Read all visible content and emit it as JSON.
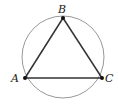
{
  "diagram": {
    "type": "geometry",
    "circle": {
      "cx": 63,
      "cy": 57,
      "r": 41,
      "stroke": "#999999"
    },
    "points": [
      {
        "id": "A",
        "label": "A",
        "x": 25,
        "y": 78
      },
      {
        "id": "B",
        "label": "B",
        "x": 63,
        "y": 18
      },
      {
        "id": "C",
        "label": "C",
        "x": 102,
        "y": 78
      }
    ],
    "edges": [
      [
        "A",
        "B"
      ],
      [
        "B",
        "C"
      ],
      [
        "A",
        "C"
      ]
    ],
    "line_color": "#333333"
  }
}
